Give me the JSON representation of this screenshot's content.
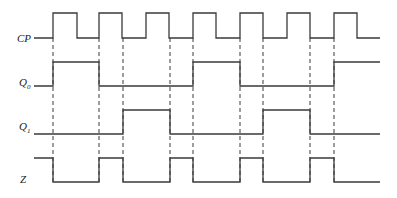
{
  "title": "",
  "signals": [
    {
      "name": "CP",
      "main": "CP",
      "sub": "",
      "label_y": 33,
      "high_y": 13,
      "low_y": 38,
      "start_x": 34,
      "end_x": 380,
      "initial": 0,
      "edges": [
        53,
        77,
        99,
        122,
        146,
        169,
        193,
        216,
        240,
        263,
        287,
        310,
        334,
        357
      ]
    },
    {
      "name": "Q0",
      "main": "Q",
      "sub": "0",
      "label_y": 77,
      "high_y": 62,
      "low_y": 86,
      "start_x": 34,
      "end_x": 380,
      "initial": 0,
      "edges": [
        53,
        99,
        193,
        240,
        334
      ]
    },
    {
      "name": "Q1",
      "main": "Q",
      "sub": "1",
      "label_y": 121,
      "high_y": 110,
      "low_y": 134,
      "start_x": 34,
      "end_x": 380,
      "initial": 0,
      "edges": [
        123,
        170,
        263,
        310
      ]
    },
    {
      "name": "Z",
      "main": "Z",
      "sub": "",
      "label_y": 173,
      "high_y": 158,
      "low_y": 182,
      "start_x": 34,
      "end_x": 380,
      "initial": 1,
      "edges": [
        53,
        99,
        123,
        170,
        193,
        240,
        263,
        310,
        334
      ]
    }
  ],
  "dashed_lines": {
    "x": [
      53,
      99,
      123,
      170,
      193,
      240,
      263,
      310,
      334
    ],
    "y1": 38,
    "y2": 184
  },
  "colors": {
    "line": "#3a3a3a",
    "background": "#ffffff"
  }
}
